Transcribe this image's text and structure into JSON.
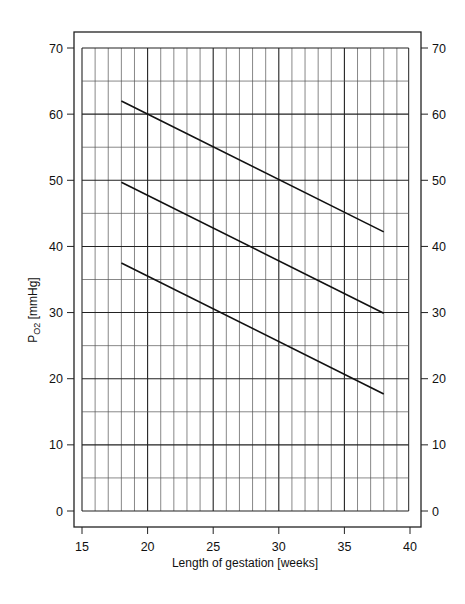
{
  "chart_data": {
    "type": "line",
    "title": "",
    "xlabel": "Length of gestation [weeks]",
    "ylabel": "P",
    "ylabel_sub": "O2",
    "ylabel_unit": " [mmHg]",
    "xlim": [
      15,
      40
    ],
    "ylim": [
      0,
      70
    ],
    "x_ticks": [
      15,
      20,
      25,
      30,
      35,
      40
    ],
    "y_ticks": [
      0,
      10,
      20,
      30,
      40,
      50,
      60,
      70
    ],
    "y_ticks_right": [
      0,
      10,
      20,
      30,
      40,
      50,
      60,
      70
    ],
    "grid": {
      "x_minor_step": 1,
      "x_major_step": 5,
      "y_minor_step": 5,
      "y_major_step": 10
    },
    "legend": null,
    "series": [
      {
        "name": "upper",
        "x": [
          18,
          38
        ],
        "y": [
          62.0,
          42.2
        ]
      },
      {
        "name": "middle",
        "x": [
          18,
          38
        ],
        "y": [
          49.7,
          29.9
        ]
      },
      {
        "name": "lower",
        "x": [
          18,
          38
        ],
        "y": [
          37.5,
          17.7
        ]
      }
    ],
    "colors": {
      "line": "#111111",
      "grid": "#333333",
      "frame": "#222222"
    }
  }
}
